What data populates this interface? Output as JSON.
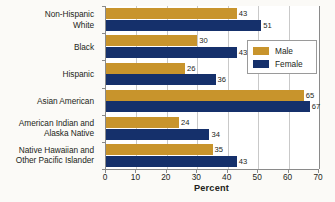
{
  "chart_data": {
    "type": "bar",
    "orientation": "horizontal",
    "title": "",
    "xlabel": "Percent",
    "ylabel": "",
    "xlim": [
      0,
      70
    ],
    "xticks": [
      0,
      10,
      20,
      30,
      40,
      50,
      60,
      70
    ],
    "grid": true,
    "legend_position": "right-upper",
    "categories": [
      "Non-Hispanic\nWhite",
      "Black",
      "Hispanic",
      "Asian American",
      "American Indian and\nAlaska Native",
      "Native Hawaiian and\nOther Pacific Islander"
    ],
    "category_lines": [
      [
        "Non-Hispanic",
        "White"
      ],
      [
        "Black"
      ],
      [
        "Hispanic"
      ],
      [
        "Asian American"
      ],
      [
        "American Indian and",
        "Alaska Native"
      ],
      [
        "Native Hawaiian and",
        "Other Pacific Islander"
      ]
    ],
    "series": [
      {
        "name": "Male",
        "color": "#c8942c",
        "values": [
          43,
          30,
          26,
          65,
          24,
          35
        ]
      },
      {
        "name": "Female",
        "color": "#15306b",
        "values": [
          51,
          43,
          36,
          67,
          34,
          43
        ]
      }
    ]
  },
  "legend": {
    "items": [
      {
        "label": "Male",
        "color": "#c8942c"
      },
      {
        "label": "Female",
        "color": "#15306b"
      }
    ]
  },
  "axis": {
    "x_title": "Percent",
    "x_tick_labels": [
      "0",
      "10",
      "20",
      "30",
      "40",
      "50",
      "60",
      "70"
    ]
  },
  "colors": {
    "male": "#c8942c",
    "female": "#15306b",
    "background": "#fbfaf7",
    "plot_background": "#ffffff",
    "gridline": "#c9c9c9",
    "axis": "#8a8a8a",
    "text": "#231f20"
  }
}
